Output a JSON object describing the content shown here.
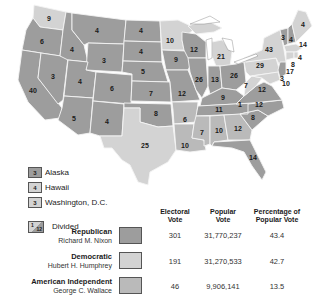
{
  "map": {
    "colors": {
      "republican": "#9d9d9d",
      "democratic": "#d3d3d3",
      "american_independent": "#bababa"
    },
    "states": [
      {
        "id": "WA",
        "votes": "9",
        "party": "democratic"
      },
      {
        "id": "OR",
        "votes": "6",
        "party": "republican"
      },
      {
        "id": "CA",
        "votes": "40",
        "party": "republican"
      },
      {
        "id": "NV",
        "votes": "3",
        "party": "republican"
      },
      {
        "id": "ID",
        "votes": "4",
        "party": "republican"
      },
      {
        "id": "MT",
        "votes": "4",
        "party": "republican"
      },
      {
        "id": "WY",
        "votes": "3",
        "party": "republican"
      },
      {
        "id": "UT",
        "votes": "4",
        "party": "republican"
      },
      {
        "id": "AZ",
        "votes": "5",
        "party": "republican"
      },
      {
        "id": "CO",
        "votes": "6",
        "party": "republican"
      },
      {
        "id": "NM",
        "votes": "4",
        "party": "republican"
      },
      {
        "id": "ND",
        "votes": "4",
        "party": "republican"
      },
      {
        "id": "SD",
        "votes": "4",
        "party": "republican"
      },
      {
        "id": "NE",
        "votes": "5",
        "party": "republican"
      },
      {
        "id": "KS",
        "votes": "7",
        "party": "republican"
      },
      {
        "id": "OK",
        "votes": "8",
        "party": "republican"
      },
      {
        "id": "TX",
        "votes": "25",
        "party": "democratic"
      },
      {
        "id": "MN",
        "votes": "10",
        "party": "democratic"
      },
      {
        "id": "IA",
        "votes": "9",
        "party": "republican"
      },
      {
        "id": "MO",
        "votes": "12",
        "party": "republican"
      },
      {
        "id": "AR",
        "votes": "6",
        "party": "american_independent"
      },
      {
        "id": "LA",
        "votes": "10",
        "party": "american_independent"
      },
      {
        "id": "WI",
        "votes": "12",
        "party": "republican"
      },
      {
        "id": "IL",
        "votes": "26",
        "party": "republican"
      },
      {
        "id": "MI",
        "votes": "21",
        "party": "democratic"
      },
      {
        "id": "IN",
        "votes": "13",
        "party": "republican"
      },
      {
        "id": "OH",
        "votes": "26",
        "party": "republican"
      },
      {
        "id": "KY",
        "votes": "9",
        "party": "republican"
      },
      {
        "id": "TN",
        "votes": "11",
        "party": "republican"
      },
      {
        "id": "MS",
        "votes": "7",
        "party": "american_independent"
      },
      {
        "id": "AL",
        "votes": "10",
        "party": "american_independent"
      },
      {
        "id": "GA",
        "votes": "12",
        "party": "american_independent"
      },
      {
        "id": "FL",
        "votes": "14",
        "party": "republican"
      },
      {
        "id": "SC",
        "votes": "8",
        "party": "republican"
      },
      {
        "id": "NC",
        "votes": "12",
        "party": "divided",
        "divided_extra": "1"
      },
      {
        "id": "VA",
        "votes": "12",
        "party": "republican"
      },
      {
        "id": "WV",
        "votes": "7",
        "party": "democratic"
      },
      {
        "id": "PA",
        "votes": "29",
        "party": "democratic"
      },
      {
        "id": "NY",
        "votes": "43",
        "party": "democratic"
      },
      {
        "id": "VT",
        "votes": "3",
        "party": "republican"
      },
      {
        "id": "NH",
        "votes": "4",
        "party": "republican"
      },
      {
        "id": "ME",
        "votes": "4",
        "party": "democratic"
      },
      {
        "id": "MA",
        "votes": "14",
        "party": "democratic"
      },
      {
        "id": "RI",
        "votes": "4",
        "party": "democratic"
      },
      {
        "id": "CT",
        "votes": "8",
        "party": "democratic"
      },
      {
        "id": "NJ",
        "votes": "17",
        "party": "republican"
      },
      {
        "id": "DE",
        "votes": "3",
        "party": "republican"
      },
      {
        "id": "MD",
        "votes": "10",
        "party": "democratic"
      }
    ]
  },
  "insets": [
    {
      "name": "Alaska",
      "votes": "3",
      "party": "republican"
    },
    {
      "name": "Hawaii",
      "votes": "4",
      "party": "democratic"
    },
    {
      "name": "Washington, D.C.",
      "votes": "3",
      "party": "democratic"
    }
  ],
  "divided_legend": {
    "label": "Divided",
    "top": "1",
    "bottom": "12"
  },
  "results_table": {
    "headers": [
      "Electoral Vote",
      "Popular Vote",
      "Percentage of Popular Vote"
    ],
    "header_lines": [
      [
        "Electoral",
        "Vote"
      ],
      [
        "Popular",
        "Vote"
      ],
      [
        "Percentage of",
        "Popular Vote"
      ]
    ],
    "rows": [
      {
        "party": "Republican",
        "candidate": "Richard M. Nixon",
        "electoral": "301",
        "popular": "31,770,237",
        "percent": "43.4",
        "color": "#9d9d9d"
      },
      {
        "party": "Democratic",
        "candidate": "Hubert H. Humphrey",
        "electoral": "191",
        "popular": "31,270,533",
        "percent": "42.7",
        "color": "#d3d3d3"
      },
      {
        "party": "American Independent",
        "candidate": "George C. Wallace",
        "electoral": "46",
        "popular": "9,906,141",
        "percent": "13.5",
        "color": "#bababa"
      }
    ]
  }
}
